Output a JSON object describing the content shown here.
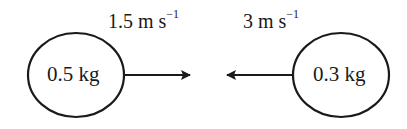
{
  "diagram": {
    "objects": [
      {
        "mass_label": "0.5 kg",
        "velocity_value": "1.5 m s",
        "velocity_exponent": "−1",
        "direction": "right"
      },
      {
        "mass_label": "0.3 kg",
        "velocity_value": "3 m s",
        "velocity_exponent": "−1",
        "direction": "left"
      }
    ],
    "colors": {
      "stroke": "#1a1a1a",
      "background": "#ffffff"
    }
  }
}
